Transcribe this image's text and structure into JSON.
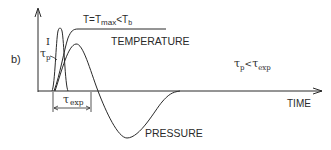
{
  "figure": {
    "panel_label": "b)",
    "colors": {
      "ink": "#2a2a2a",
      "background": "#ffffff"
    },
    "labels": {
      "pulse": "I",
      "tau_p_symbol": "τ",
      "tau_p_sub": "p",
      "plateau_eq_prefix": "T=T",
      "plateau_eq_max": "max",
      "plateau_eq_lt": "<T",
      "plateau_eq_b": "b",
      "temperature": "TEMPERATURE",
      "condition_tau1": "τ",
      "condition_sub1": "p",
      "condition_lt": "<",
      "condition_tau2": "τ",
      "condition_sub2": "exp",
      "tau_exp_symbol": "τ",
      "tau_exp_sub": "exp",
      "x_axis": "TIME",
      "pressure": "PRESSURE"
    },
    "curves": [
      {
        "name": "laser pulse intensity I",
        "shape": "narrow gaussian pulse near t=0"
      },
      {
        "name": "temperature",
        "shape": "rises then plateaus at T=Tmax<Tb"
      },
      {
        "name": "pressure",
        "shape": "positive peak then deep negative trough, returns to zero"
      }
    ],
    "annotations": {
      "tau_exp": "interval marked by double arrow below time axis"
    }
  }
}
